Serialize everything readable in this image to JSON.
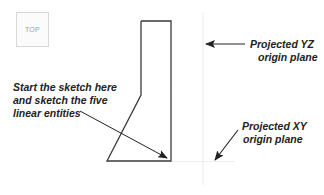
{
  "viewport": {
    "view_cube_label": "TOP",
    "colors": {
      "background": "#ffffff",
      "sketch_line": "#333333",
      "plane_line": "#ececec",
      "arrow": "#222222",
      "annotation_text": "#222222"
    }
  },
  "sketch": {
    "entity_count": 5,
    "points": [
      [
        141,
        21
      ],
      [
        171,
        21
      ],
      [
        171,
        161
      ],
      [
        107,
        161
      ],
      [
        141,
        95
      ]
    ]
  },
  "annotations": {
    "start_sketch": {
      "lines": [
        "Start the sketch here",
        "and sketch the five",
        "linear entities"
      ]
    },
    "yz_plane": {
      "lines": [
        "Projected YZ",
        "origin plane"
      ]
    },
    "xy_plane": {
      "lines": [
        "Projected XY",
        "origin plane"
      ]
    }
  }
}
